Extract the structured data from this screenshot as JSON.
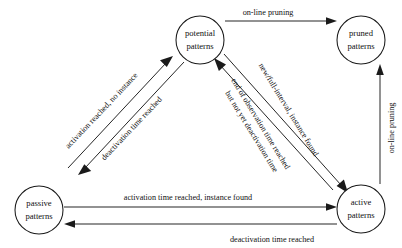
{
  "diagram": {
    "kind": "state-transition-diagram",
    "background_color": "#ffffff",
    "line_color": "#1a1a1a",
    "text_color": "#111111",
    "nodes": [
      {
        "id": "potential",
        "line1": "potential",
        "line2": "patterns",
        "cx": 200,
        "cy": 40,
        "r": 24
      },
      {
        "id": "pruned",
        "line1": "pruned",
        "line2": "patterns",
        "cx": 361,
        "cy": 40,
        "r": 24
      },
      {
        "id": "passive",
        "line1": "passive",
        "line2": "patterns",
        "cx": 39,
        "cy": 210,
        "r": 24
      },
      {
        "id": "active",
        "line1": "active",
        "line2": "patterns",
        "cx": 361,
        "cy": 209,
        "r": 24
      }
    ],
    "edges": [
      {
        "id": "potential-to-pruned",
        "from": "potential",
        "to": "pruned",
        "label": "on-line pruning",
        "label_x": 268,
        "label_y": 13,
        "rotate": 0
      },
      {
        "id": "passive-to-potential",
        "from": "passive",
        "to": "potential",
        "label": "activation reached, no instance",
        "label_x": 102,
        "label_y": 111,
        "rotate": -46.5
      },
      {
        "id": "potential-to-passive",
        "from": "potential",
        "to": "passive",
        "label": "deactivation time reached",
        "label_x": 132,
        "label_y": 129,
        "rotate": -46.5
      },
      {
        "id": "potential-to-active",
        "from": "potential",
        "to": "active",
        "label": "new/full-interval, instance found",
        "label_x": 288,
        "label_y": 110,
        "rotate": 58.5
      },
      {
        "id": "active-to-potential-line1",
        "from": "active",
        "to": "potential",
        "label": "end of observation time reached",
        "label_x": 258,
        "label_y": 125,
        "rotate": 58.5
      },
      {
        "id": "active-to-potential-line2",
        "from": "active",
        "to": "potential",
        "label": "but not yet deactivation time",
        "label_x": 248,
        "label_y": 131,
        "rotate": 58.5
      },
      {
        "id": "passive-to-active",
        "from": "passive",
        "to": "active",
        "label": "activation time reached, instance found",
        "label_x": 188,
        "label_y": 198,
        "rotate": 0
      },
      {
        "id": "active-to-passive",
        "from": "active",
        "to": "passive",
        "label": "deactivation time reached",
        "label_x": 272,
        "label_y": 240,
        "rotate": 0
      },
      {
        "id": "active-to-pruned",
        "from": "active",
        "to": "pruned",
        "label": "on-line pruning",
        "label_x": 392,
        "label_y": 128,
        "rotate": -90
      }
    ]
  }
}
